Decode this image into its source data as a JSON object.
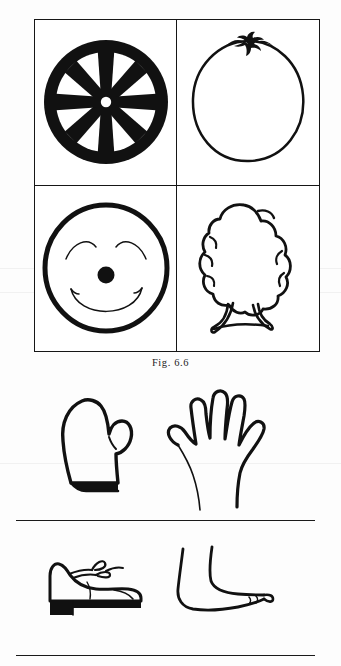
{
  "page": {
    "background_color": "#fdfdfd",
    "ink_color": "#111111",
    "kind": "scanned-book-figure-plate"
  },
  "figure": {
    "caption": "Fig. 6.6",
    "frame": {
      "columns": 2,
      "rows": 2,
      "border_color": "#161616"
    },
    "cells": [
      {
        "position": "top-left",
        "drawing_name": "wagon-wheel",
        "label": "wheel",
        "style": "solid-black-silhouette",
        "spokes": 8,
        "has_hub": true
      },
      {
        "position": "top-right",
        "drawing_name": "orange-fruit",
        "label": "orange",
        "style": "outline-contour",
        "has_stem": true,
        "stem_color": "#111111"
      },
      {
        "position": "bottom-left",
        "drawing_name": "smiling-face",
        "label": "face",
        "style": "outline-contour",
        "features": [
          "closed-curved-eyes",
          "round-dot-nose",
          "smiling-mouth"
        ]
      },
      {
        "position": "bottom-right",
        "drawing_name": "bird-chick",
        "label": "bird",
        "style": "outline-contour",
        "features": [
          "fluffy-body",
          "two-legs",
          "standing"
        ]
      }
    ]
  },
  "panels": [
    {
      "panel_name": "hand-panel",
      "items": [
        {
          "drawing_name": "mitten",
          "label": "mitten",
          "side": "left",
          "style": "outline-with-filled-cuff"
        },
        {
          "drawing_name": "open-hand",
          "label": "hand",
          "side": "right",
          "style": "outline-contour",
          "fingers": 5
        }
      ]
    },
    {
      "panel_name": "foot-panel",
      "items": [
        {
          "drawing_name": "laced-shoe",
          "label": "shoe",
          "side": "left",
          "style": "outline-with-filled-sole",
          "has_laces": true
        },
        {
          "drawing_name": "bare-foot",
          "label": "foot",
          "side": "right",
          "style": "outline-contour"
        }
      ]
    }
  ],
  "rules": [
    {
      "rule_name": "divider-rule-middle"
    },
    {
      "rule_name": "divider-rule-bottom"
    }
  ]
}
